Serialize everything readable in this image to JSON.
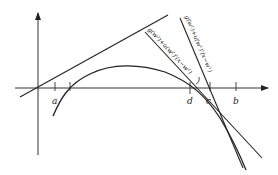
{
  "figure": {
    "axes": {
      "x_axis": "horizontal axis with arrow",
      "y_axis": "vertical axis with arrow"
    },
    "tick_labels": {
      "a": "a",
      "d": "d",
      "c": "c",
      "b": "b"
    },
    "line_labels": {
      "tangent_w1": "g(w¹)+u(w¹)'(x−w¹)",
      "tangent_w2": "g(w²)+u(w²)'(x−w²)"
    },
    "colors": {
      "stroke": "#222222",
      "background": "#ffffff"
    }
  }
}
